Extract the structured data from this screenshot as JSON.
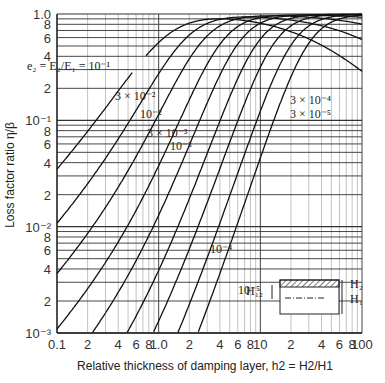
{
  "chart_data": {
    "type": "line",
    "title": "",
    "xlabel": "Relative thickness of damping layer, h2 = H2/H1",
    "ylabel": "Loss factor ratio η/β",
    "xscale": "log",
    "yscale": "log",
    "xlim": [
      0.1,
      100
    ],
    "ylim": [
      0.001,
      1.0
    ],
    "grid": true,
    "x_tick_labels": [
      {
        "v": 0.1,
        "t": "0.1"
      },
      {
        "v": 0.2,
        "t": "2"
      },
      {
        "v": 0.4,
        "t": "4"
      },
      {
        "v": 0.6,
        "t": "6"
      },
      {
        "v": 0.8,
        "t": "8"
      },
      {
        "v": 1,
        "t": "1.0"
      },
      {
        "v": 2,
        "t": "2"
      },
      {
        "v": 4,
        "t": "4"
      },
      {
        "v": 6,
        "t": "6"
      },
      {
        "v": 8,
        "t": "8"
      },
      {
        "v": 10,
        "t": "10"
      },
      {
        "v": 20,
        "t": "2"
      },
      {
        "v": 40,
        "t": "4"
      },
      {
        "v": 60,
        "t": "6"
      },
      {
        "v": 80,
        "t": "8"
      },
      {
        "v": 100,
        "t": "100"
      }
    ],
    "y_tick_labels": [
      {
        "v": 1.0,
        "t": "1.0"
      },
      {
        "v": 0.8,
        "t": "8"
      },
      {
        "v": 0.6,
        "t": "6"
      },
      {
        "v": 0.4,
        "t": "4"
      },
      {
        "v": 0.2,
        "t": "2"
      },
      {
        "v": 0.1,
        "t": "10⁻¹"
      },
      {
        "v": 0.08,
        "t": "8"
      },
      {
        "v": 0.06,
        "t": "6"
      },
      {
        "v": 0.04,
        "t": "4"
      },
      {
        "v": 0.02,
        "t": "2"
      },
      {
        "v": 0.01,
        "t": "10⁻²"
      },
      {
        "v": 0.008,
        "t": "8"
      },
      {
        "v": 0.006,
        "t": "6"
      },
      {
        "v": 0.004,
        "t": "4"
      },
      {
        "v": 0.002,
        "t": "2"
      },
      {
        "v": 0.001,
        "t": "10⁻³"
      }
    ],
    "formula": "η/β = e2·h2·(3+6h2+4h2²) / (1 + e2·h2·(4+6h2+4h2²) + e2²·h2⁴)",
    "series": [
      {
        "name": "e2 = E2/E1 = 10⁻¹",
        "e2": 0.1,
        "label": "e₂ = E₂/E₁ = 10⁻¹"
      },
      {
        "name": "3 × 10⁻²",
        "e2": 0.03,
        "label": "3 × 10⁻²"
      },
      {
        "name": "10⁻²",
        "e2": 0.01,
        "label": "10⁻²"
      },
      {
        "name": "3 × 10⁻³",
        "e2": 0.003,
        "label": "3 × 10⁻³"
      },
      {
        "name": "10⁻³",
        "e2": 0.001,
        "label": "10⁻³"
      },
      {
        "name": "3 × 10⁻⁴",
        "e2": 0.0003,
        "label": "3 × 10⁻⁴"
      },
      {
        "name": "10⁻⁴",
        "e2": 0.0001,
        "label": "10⁻⁴"
      },
      {
        "name": "3 × 10⁻⁵",
        "e2": 3e-05,
        "label": "3 × 10⁻⁵"
      },
      {
        "name": "10⁻⁵",
        "e2": 1e-05,
        "label": "10⁻⁵"
      }
    ],
    "inset": {
      "h2_label": "H₂",
      "h1_label": "H₁",
      "h12_label": "H₁₂"
    }
  }
}
